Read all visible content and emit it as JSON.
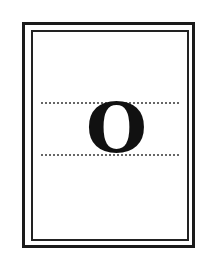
{
  "card": {
    "letter": "O",
    "frame": {
      "outer_border_color": "#1a1a1a",
      "inner_border_color": "#222222",
      "background": "#ffffff"
    },
    "guides": {
      "style": "dotted",
      "color": "#666666",
      "count": 2
    }
  }
}
